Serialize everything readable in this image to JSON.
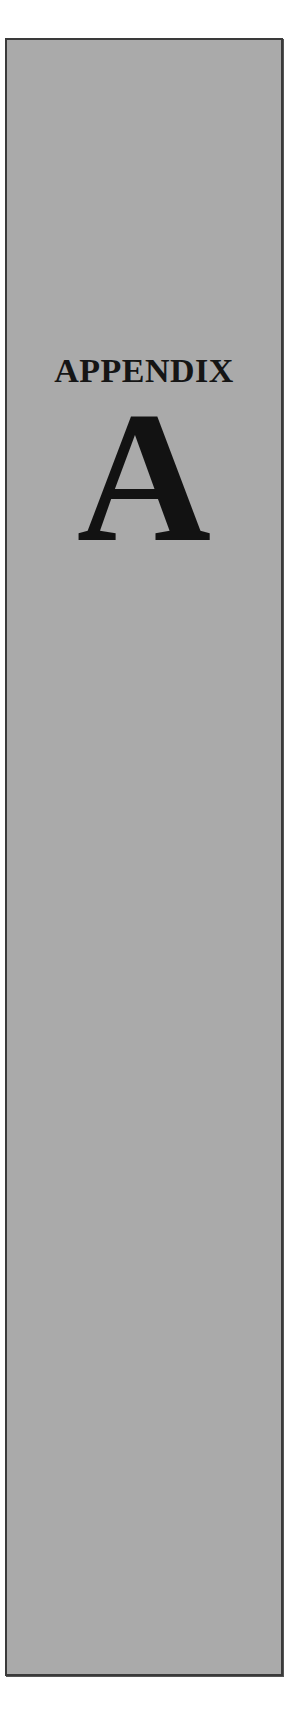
{
  "appendix_tab": {
    "heading": "APPENDIX",
    "letter": "A",
    "colors": {
      "panel_fill": "#aaaaaa",
      "border": "#3a3a3a",
      "text": "#151515",
      "page_background": "#ffffff"
    }
  }
}
